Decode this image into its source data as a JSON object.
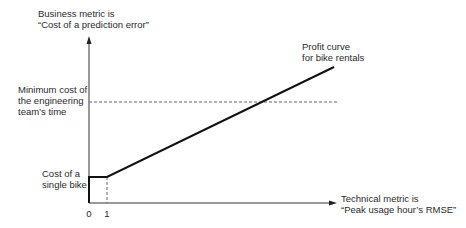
{
  "diagram": {
    "y_axis": {
      "label_line1": "Business metric is",
      "label_line2": "“Cost of a prediction error”"
    },
    "x_axis": {
      "label_line1": "Technical metric is",
      "label_line2": "“Peak usage hour’s RMSE”",
      "ticks": [
        "0",
        "1"
      ]
    },
    "annotations": {
      "min_cost_line1": "Minimum cost of",
      "min_cost_line2": "the engineering",
      "min_cost_line3": "team’s time",
      "single_bike_line1": "Cost of a",
      "single_bike_line2": "single bike",
      "curve_line1": "Profit curve",
      "curve_line2": "for bike rentals"
    },
    "colors": {
      "line": "#111111",
      "axis": "#333333",
      "dashed": "#555555"
    }
  }
}
